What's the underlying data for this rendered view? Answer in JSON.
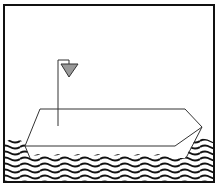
{
  "illustration": {
    "subject": "boat-on-waves",
    "colors": {
      "frame": "#111111",
      "background": "#ffffff",
      "flag": "#999999",
      "waves": "#111111"
    }
  }
}
